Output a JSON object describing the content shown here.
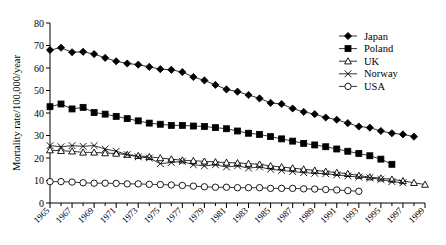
{
  "chart_data": {
    "type": "line",
    "title": "",
    "xlabel": "",
    "ylabel": "Mortality rate/100,000/year",
    "xlim": [
      1965,
      1999
    ],
    "ylim": [
      0,
      80
    ],
    "yticks": [
      0,
      10,
      20,
      30,
      40,
      50,
      60,
      70,
      80
    ],
    "ytick_labels": [
      "0",
      "10",
      "20",
      "30",
      "40",
      "50",
      "60",
      "70",
      "80"
    ],
    "xticks": [
      1965,
      1967,
      1969,
      1971,
      1973,
      1975,
      1977,
      1979,
      1981,
      1983,
      1985,
      1987,
      1989,
      1991,
      1993,
      1995,
      1997,
      1999
    ],
    "xtick_labels": [
      "1965",
      "1967",
      "1969",
      "1971",
      "1973",
      "1975",
      "1977",
      "1979",
      "1981",
      "1983",
      "1985",
      "1987",
      "1989",
      "1991",
      "1993",
      "1995",
      "1997",
      "1999"
    ],
    "x_minor_ticks": [
      1966,
      1968,
      1970,
      1972,
      1974,
      1976,
      1978,
      1980,
      1982,
      1984,
      1986,
      1988,
      1990,
      1992,
      1994,
      1996,
      1998
    ],
    "grid": false,
    "legend_position": "top-right",
    "series": [
      {
        "name": "Japan",
        "marker": "filled-diamond",
        "color": "#000000",
        "x": [
          1965,
          1966,
          1967,
          1968,
          1969,
          1970,
          1971,
          1972,
          1973,
          1974,
          1975,
          1976,
          1977,
          1978,
          1979,
          1980,
          1981,
          1982,
          1983,
          1984,
          1985,
          1986,
          1987,
          1988,
          1989,
          1990,
          1991,
          1992,
          1993,
          1994,
          1995,
          1996,
          1997,
          1998
        ],
        "values": [
          68.0,
          69.0,
          67.0,
          67.2,
          66.2,
          64.5,
          63.0,
          62.0,
          61.5,
          60.5,
          59.5,
          59.2,
          58.2,
          56.0,
          54.5,
          52.5,
          50.5,
          49.5,
          48.0,
          46.5,
          44.5,
          44.0,
          42.0,
          40.5,
          39.5,
          38.0,
          37.0,
          35.5,
          34.0,
          33.5,
          32.0,
          31.0,
          30.5,
          29.5
        ]
      },
      {
        "name": "Poland",
        "marker": "filled-square",
        "color": "#000000",
        "x": [
          1965,
          1966,
          1967,
          1968,
          1969,
          1970,
          1971,
          1972,
          1973,
          1974,
          1975,
          1976,
          1977,
          1978,
          1979,
          1980,
          1981,
          1982,
          1983,
          1984,
          1985,
          1986,
          1987,
          1988,
          1989,
          1990,
          1991,
          1992,
          1993,
          1994,
          1995,
          1996
        ],
        "values": [
          42.8,
          44.0,
          41.8,
          42.5,
          40.2,
          39.5,
          38.5,
          37.5,
          36.5,
          35.5,
          35.0,
          34.5,
          34.5,
          34.2,
          34.0,
          33.5,
          33.0,
          32.0,
          31.0,
          30.5,
          29.5,
          28.5,
          27.5,
          26.5,
          25.8,
          25.0,
          24.0,
          23.0,
          22.0,
          21.0,
          19.5,
          17.2
        ]
      },
      {
        "name": "UK",
        "marker": "open-triangle",
        "color": "#000000",
        "x": [
          1965,
          1966,
          1967,
          1968,
          1969,
          1970,
          1971,
          1972,
          1973,
          1974,
          1975,
          1976,
          1977,
          1978,
          1979,
          1980,
          1981,
          1982,
          1983,
          1984,
          1985,
          1986,
          1987,
          1988,
          1989,
          1990,
          1991,
          1992,
          1993,
          1994,
          1995,
          1996,
          1997,
          1998,
          1999
        ],
        "values": [
          23.5,
          23.2,
          23.0,
          22.5,
          22.5,
          22.2,
          22.0,
          21.5,
          21.0,
          20.5,
          20.0,
          19.5,
          19.0,
          18.8,
          18.5,
          18.2,
          18.0,
          17.8,
          17.5,
          17.2,
          16.5,
          16.0,
          15.5,
          15.0,
          14.5,
          14.0,
          13.5,
          13.0,
          12.2,
          11.5,
          11.0,
          10.5,
          9.8,
          9.0,
          8.2
        ]
      },
      {
        "name": "Norway",
        "marker": "cross",
        "color": "#000000",
        "x": [
          1965,
          1966,
          1967,
          1968,
          1969,
          1970,
          1971,
          1972,
          1973,
          1974,
          1975,
          1976,
          1977,
          1978,
          1979,
          1980,
          1981,
          1982,
          1983,
          1984,
          1985,
          1986,
          1987,
          1988,
          1989,
          1990,
          1991,
          1992,
          1993,
          1994,
          1995,
          1996,
          1997
        ],
        "values": [
          25.5,
          25.0,
          25.5,
          25.2,
          25.5,
          24.0,
          23.0,
          21.5,
          20.5,
          20.0,
          17.5,
          18.0,
          18.5,
          17.0,
          16.5,
          17.0,
          16.0,
          16.5,
          15.5,
          16.0,
          15.0,
          14.5,
          14.0,
          13.5,
          13.2,
          13.0,
          12.5,
          12.0,
          11.5,
          11.2,
          10.5,
          9.5,
          9.0
        ]
      },
      {
        "name": "USA",
        "marker": "open-circle",
        "color": "#000000",
        "x": [
          1965,
          1966,
          1967,
          1968,
          1969,
          1970,
          1971,
          1972,
          1973,
          1974,
          1975,
          1976,
          1977,
          1978,
          1979,
          1980,
          1981,
          1982,
          1983,
          1984,
          1985,
          1986,
          1987,
          1988,
          1989,
          1990,
          1991,
          1992,
          1993
        ],
        "values": [
          9.5,
          9.5,
          9.3,
          9.0,
          8.8,
          8.8,
          8.7,
          8.5,
          8.5,
          8.3,
          8.2,
          8.0,
          7.8,
          7.5,
          7.2,
          7.0,
          7.0,
          6.8,
          6.8,
          6.8,
          6.5,
          6.5,
          6.5,
          6.3,
          6.2,
          6.0,
          5.8,
          5.5,
          5.2
        ]
      }
    ]
  },
  "legend": {
    "entries": [
      {
        "label": "Japan",
        "marker": "filled-diamond"
      },
      {
        "label": "Poland",
        "marker": "filled-square"
      },
      {
        "label": "UK",
        "marker": "open-triangle"
      },
      {
        "label": "Norway",
        "marker": "cross"
      },
      {
        "label": "USA",
        "marker": "open-circle"
      }
    ]
  }
}
